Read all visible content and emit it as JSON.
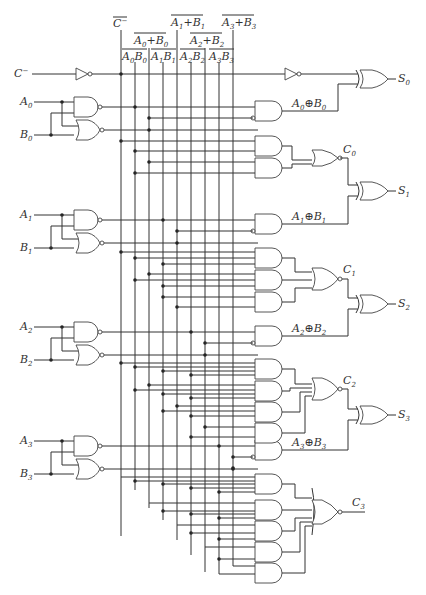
{
  "diagram": {
    "inputs": {
      "carry_in": "C",
      "a": [
        "A0",
        "A1",
        "A2",
        "A3"
      ],
      "b": [
        "B0",
        "B1",
        "B2",
        "B3"
      ]
    },
    "bus_labels": {
      "c_bar": "C̄",
      "p0": "A0+B0",
      "p1": "A1+B1",
      "p2": "A2+B2",
      "p3": "A3+B3",
      "g0": "A0B0",
      "g1": "A1B1",
      "g2": "A2B2",
      "g3": "A3B3"
    },
    "xor_labels": [
      "A0⊕B0",
      "A1⊕B1",
      "A2⊕B2",
      "A3⊕B3"
    ],
    "outputs": {
      "sums": [
        "S0",
        "S1",
        "S2",
        "S3"
      ],
      "carries": [
        "C0",
        "C1",
        "C2",
        "C3"
      ]
    },
    "bus_x": [
      121,
      135,
      149,
      163,
      177,
      191,
      205,
      219,
      233
    ]
  }
}
